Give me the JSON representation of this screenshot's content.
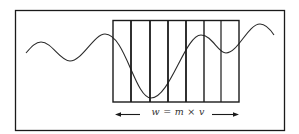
{
  "diagram": {
    "title": "",
    "formula": "w = m × v",
    "colors": {
      "line": "#1a1a1a",
      "wave": "#2a2a2a",
      "background": "#ffffff"
    },
    "frame": {
      "x": 15,
      "y": 10,
      "width": 270,
      "height": 121
    },
    "grid": {
      "x": 113,
      "y": 20,
      "width": 126,
      "height": 82,
      "columns": 7,
      "divider_x": [
        131,
        150,
        168,
        186,
        204,
        221
      ]
    },
    "wave": {
      "description": "sinusoidal wave passing through the grid, deepest trough inside the grid",
      "points": [
        [
          26,
          53
        ],
        [
          41,
          42
        ],
        [
          70,
          61
        ],
        [
          105,
          34
        ],
        [
          151,
          98
        ],
        [
          201,
          35
        ],
        [
          226,
          53
        ],
        [
          260,
          24
        ],
        [
          274,
          35
        ]
      ]
    },
    "arrows": [
      {
        "direction": "left",
        "from_x": 140,
        "to_x": 116,
        "y": 114
      },
      {
        "direction": "right",
        "from_x": 212,
        "to_x": 238,
        "y": 114
      }
    ]
  }
}
